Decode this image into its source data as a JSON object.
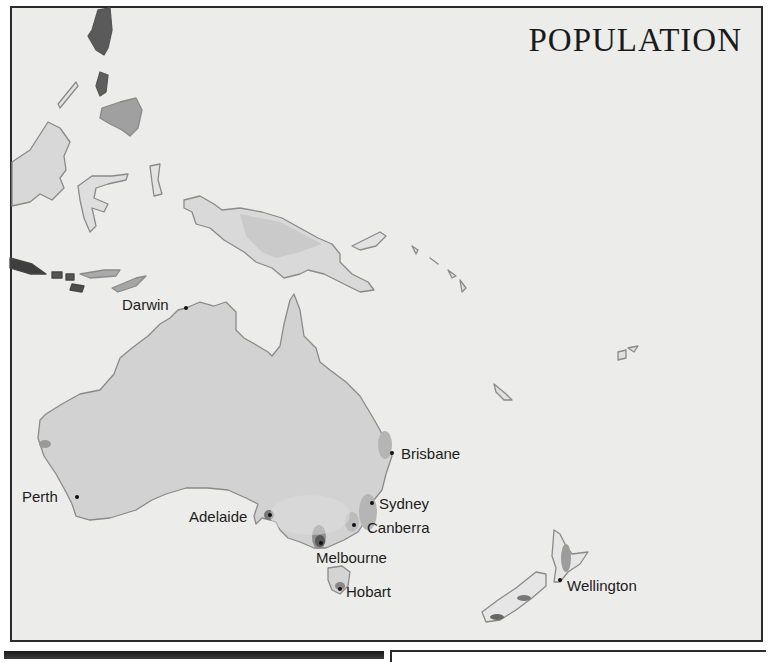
{
  "map": {
    "title": "POPULATION",
    "colors": {
      "sea": "#ececea",
      "land_sparse": "#dcdcdc",
      "land_low": "#cfcfcf",
      "density_medium": "#a9a9a9",
      "density_high": "#7a7a7a",
      "density_very_high": "#4a4a4a",
      "coastline": "#8a8a8a",
      "frame": "#2a2a2a"
    },
    "cities": [
      {
        "name": "Darwin",
        "dot_x": 186,
        "dot_y": 308,
        "label_x": 122,
        "label_y": 297
      },
      {
        "name": "Brisbane",
        "dot_x": 392,
        "dot_y": 453,
        "label_x": 401,
        "label_y": 446
      },
      {
        "name": "Perth",
        "dot_x": 77,
        "dot_y": 497,
        "label_x": 22,
        "label_y": 489
      },
      {
        "name": "Sydney",
        "dot_x": 372,
        "dot_y": 503,
        "label_x": 379,
        "label_y": 496
      },
      {
        "name": "Adelaide",
        "dot_x": 270,
        "dot_y": 515,
        "label_x": 189,
        "label_y": 509
      },
      {
        "name": "Canberra",
        "dot_x": 354,
        "dot_y": 525,
        "label_x": 367,
        "label_y": 520
      },
      {
        "name": "Melbourne",
        "dot_x": 321,
        "dot_y": 543,
        "label_x": 316,
        "label_y": 550
      },
      {
        "name": "Hobart",
        "dot_x": 340,
        "dot_y": 589,
        "label_x": 346,
        "label_y": 584
      },
      {
        "name": "Wellington",
        "dot_x": 560,
        "dot_y": 580,
        "label_x": 567,
        "label_y": 578
      }
    ]
  }
}
